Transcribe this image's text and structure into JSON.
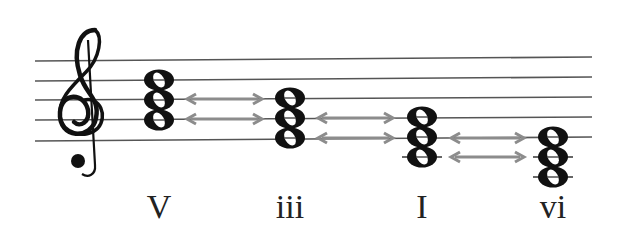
{
  "diagram": {
    "type": "music-staff",
    "clef": "treble",
    "clef_icon": "treble-clef-icon",
    "staff": {
      "lines": 5,
      "x_start": 35,
      "x_end": 592,
      "left_y": [
        61,
        81,
        100,
        120,
        141
      ],
      "right_y": [
        57,
        77,
        97,
        117,
        137
      ],
      "color": "#555555"
    },
    "chords": [
      {
        "roman": "V",
        "x": 159,
        "notes_y": [
          80,
          100,
          120
        ],
        "ledger": []
      },
      {
        "roman": "iii",
        "x": 290,
        "notes_y": [
          98,
          118,
          138
        ],
        "ledger": []
      },
      {
        "roman": "I",
        "x": 422,
        "notes_y": [
          117,
          137,
          157
        ],
        "ledger": [
          157
        ]
      },
      {
        "roman": "vi",
        "x": 553,
        "notes_y": [
          137,
          157,
          177
        ],
        "ledger": [
          157,
          177
        ]
      }
    ],
    "arrows": [
      {
        "x1": 187,
        "x2": 262,
        "y": 99,
        "type": "double"
      },
      {
        "x1": 187,
        "x2": 262,
        "y": 119,
        "type": "double"
      },
      {
        "x1": 318,
        "x2": 393,
        "y": 118,
        "type": "double"
      },
      {
        "x1": 318,
        "x2": 393,
        "y": 138,
        "type": "double"
      },
      {
        "x1": 451,
        "x2": 524,
        "y": 138,
        "type": "double"
      },
      {
        "x1": 451,
        "x2": 524,
        "y": 157,
        "type": "double"
      }
    ],
    "arrow_color": "#8c8c8c",
    "note_color": "#111111",
    "labels": [
      "V",
      "iii",
      "I",
      "vi"
    ]
  }
}
